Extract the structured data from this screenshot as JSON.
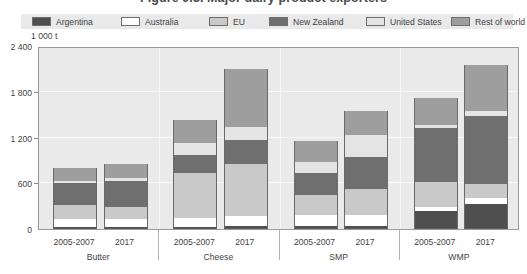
{
  "figure": {
    "title": "Figure 9.3.  Major dairy product exporters",
    "unit_label": "1 000 t"
  },
  "legend": {
    "position": "top",
    "items": [
      {
        "label": "Argentina",
        "color": "#4f4f4f"
      },
      {
        "label": "Australia",
        "color": "#ffffff"
      },
      {
        "label": "EU",
        "color": "#c9c9c9"
      },
      {
        "label": "New Zealand",
        "color": "#6f6f6f"
      },
      {
        "label": "United States",
        "color": "#e4e4e4"
      },
      {
        "label": "Rest of world",
        "color": "#9e9e9e"
      }
    ]
  },
  "chart_data": {
    "type": "bar",
    "title": "Figure 9.3.  Major dairy product exporters",
    "subtitle": "",
    "xlabel": "",
    "ylabel": "1 000 t",
    "ylim": [
      0,
      2400
    ],
    "yticks": [
      "0",
      "600",
      "1 200",
      "1 800",
      "2 400"
    ],
    "ytick_values": [
      0,
      600,
      1200,
      1800,
      2400
    ],
    "grid": true,
    "stacked": true,
    "groups": [
      "Butter",
      "Cheese",
      "SMP",
      "WMP"
    ],
    "categories": [
      "Butter 2005-2007",
      "Butter 2017",
      "Cheese 2005-2007",
      "Cheese 2017",
      "SMP 2005-2007",
      "SMP 2017",
      "WMP 2005-2007",
      "WMP 2017"
    ],
    "period_labels": [
      "2005-2007",
      "2017"
    ],
    "series": [
      {
        "name": "Argentina",
        "color": "#4f4f4f",
        "values": [
          25,
          20,
          30,
          35,
          45,
          40,
          230,
          330
        ]
      },
      {
        "name": "Australia",
        "color": "#ffffff",
        "values": [
          100,
          115,
          120,
          130,
          140,
          150,
          60,
          75
        ]
      },
      {
        "name": "EU",
        "color": "#c9c9c9",
        "values": [
          190,
          150,
          580,
          690,
          260,
          330,
          330,
          180
        ]
      },
      {
        "name": "New Zealand",
        "color": "#6f6f6f",
        "values": [
          290,
          345,
          240,
          310,
          290,
          420,
          700,
          900
        ]
      },
      {
        "name": "United States",
        "color": "#e4e4e4",
        "values": [
          30,
          40,
          160,
          170,
          150,
          290,
          40,
          60
        ]
      },
      {
        "name": "Rest of world",
        "color": "#9e9e9e",
        "values": [
          165,
          180,
          300,
          765,
          265,
          320,
          360,
          605
        ]
      }
    ],
    "totals": [
      800,
      850,
      1430,
      2100,
      1150,
      1550,
      1720,
      2150
    ]
  },
  "axis": {
    "xlabels": [
      {
        "group": "Butter",
        "periods": [
          "2005-2007",
          "2017"
        ]
      },
      {
        "group": "Cheese",
        "periods": [
          "2005-2007",
          "2017"
        ]
      },
      {
        "group": "SMP",
        "periods": [
          "2005-2007",
          "2017"
        ]
      },
      {
        "group": "WMP",
        "periods": [
          "2005-2007",
          "2017"
        ]
      }
    ]
  }
}
